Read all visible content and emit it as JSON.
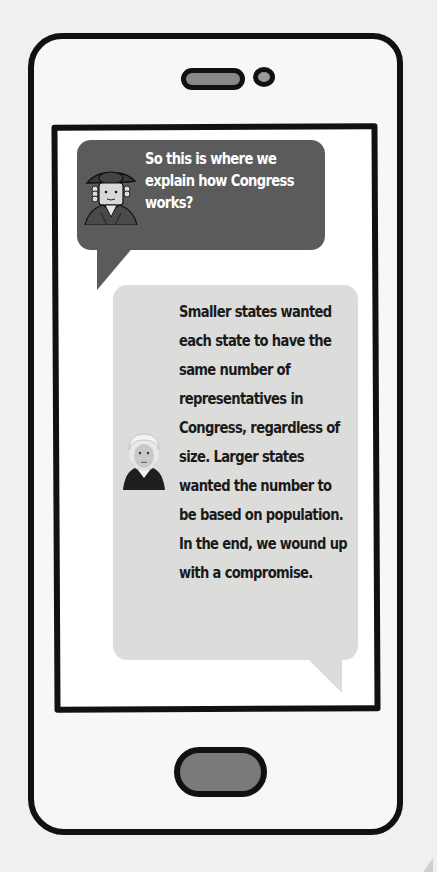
{
  "phone": {
    "frame_color": "#111111",
    "body_color": "#f7f7f6",
    "screen_color": "#ffffff",
    "home_button_color": "#7a7a7a"
  },
  "conversation": {
    "messages": [
      {
        "speaker": "colonial-character",
        "avatar_icon": "colonial-man-avatar",
        "bubble_color": "#5b5b5b",
        "text_color": "#ffffff",
        "text": "So this is where we explain how Congress works?"
      },
      {
        "speaker": "george-washington",
        "avatar_icon": "george-washington-avatar",
        "bubble_color": "#dcdcdb",
        "text_color": "#1a1a1a",
        "text": "Smaller states wanted each state to have the same number of representatives in Congress, regardless of size. Larger states wanted the number to be based on population. In the end, we wound up with a compromise."
      }
    ]
  }
}
